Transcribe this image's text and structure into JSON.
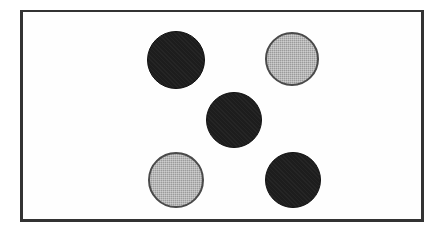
{
  "figure": {
    "background_color": "#ffffff",
    "panel_color": "#fefefe",
    "frame": {
      "border_color": "#333333",
      "border_width_px": 3,
      "x": 20,
      "y": 10,
      "width": 404,
      "height": 212
    },
    "counts": {
      "total": 5,
      "black": 3,
      "gray": 2
    },
    "colors": {
      "black_fill": "#1d1d1d",
      "gray_fill": "#9b9b9b",
      "gray_outline": "#4a4a4a"
    },
    "circles": [
      {
        "id": "circle-top-left",
        "label": "Black circle, upper left",
        "fill": "black",
        "fill_color": "#1d1d1d",
        "center_x": 176,
        "center_y": 60,
        "radius": 29,
        "diameter": 58
      },
      {
        "id": "circle-top-right",
        "label": "Gray circle, upper right",
        "fill": "gray",
        "fill_color": "#9b9b9b",
        "center_x": 292,
        "center_y": 59,
        "radius": 27,
        "diameter": 54
      },
      {
        "id": "circle-center",
        "label": "Black circle, center",
        "fill": "black",
        "fill_color": "#1d1d1d",
        "center_x": 234,
        "center_y": 120,
        "radius": 28,
        "diameter": 56
      },
      {
        "id": "circle-bottom-left",
        "label": "Gray circle, lower left",
        "fill": "gray",
        "fill_color": "#9b9b9b",
        "center_x": 176,
        "center_y": 180,
        "radius": 28,
        "diameter": 56
      },
      {
        "id": "circle-bottom-right",
        "label": "Black circle, lower right",
        "fill": "black",
        "fill_color": "#1d1d1d",
        "center_x": 293,
        "center_y": 180,
        "radius": 28,
        "diameter": 56
      }
    ]
  }
}
